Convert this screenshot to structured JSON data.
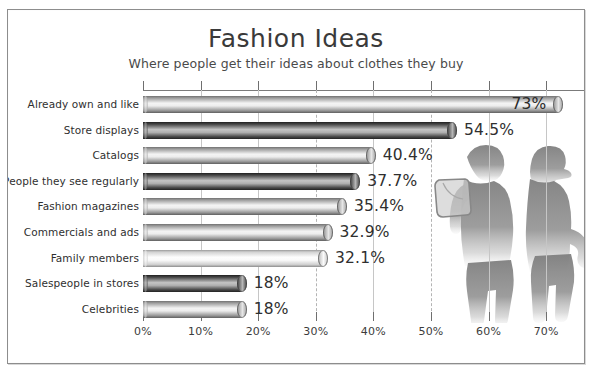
{
  "chart_data": {
    "type": "bar",
    "orientation": "horizontal",
    "title": "Fashion Ideas",
    "subtitle": "Where people get their ideas about clothes they buy",
    "xlabel": "",
    "ylabel": "",
    "xlim": [
      0,
      73
    ],
    "grid": true,
    "legend": false,
    "categories": [
      "Already own and like",
      "Store displays",
      "Catalogs",
      "People they see regularly",
      "Fashion magazines",
      "Commercials and ads",
      "Family members",
      "Salespeople in stores",
      "Celebrities"
    ],
    "values": [
      73,
      54.5,
      40.4,
      37.7,
      35.4,
      32.9,
      32.1,
      18,
      18
    ],
    "value_labels": [
      "73%",
      "54.5%",
      "40.4%",
      "37.7%",
      "35.4%",
      "32.9%",
      "32.1%",
      "18%",
      "18%"
    ],
    "xticks": [
      0,
      10,
      20,
      30,
      40,
      50,
      60,
      70
    ],
    "xtick_labels": [
      "0%",
      "10%",
      "20%",
      "30%",
      "40%",
      "50%",
      "60%",
      "70%"
    ],
    "bar_tones": [
      "light",
      "dark",
      "light",
      "dark",
      "light",
      "light",
      "lightest",
      "dark",
      "light"
    ],
    "annotation": "Two shopper silhouettes watermark at right side of plot"
  },
  "bars": [
    {
      "label": "Already own and like",
      "value": 73,
      "display": "73%",
      "tone": "light",
      "label_inside": true
    },
    {
      "label": "Store displays",
      "value": 54.5,
      "display": "54.5%",
      "tone": "dark",
      "label_inside": false
    },
    {
      "label": "Catalogs",
      "value": 40.4,
      "display": "40.4%",
      "tone": "light",
      "label_inside": false
    },
    {
      "label": "People they see regularly",
      "value": 37.7,
      "display": "37.7%",
      "tone": "dark",
      "label_inside": false
    },
    {
      "label": "Fashion magazines",
      "value": 35.4,
      "display": "35.4%",
      "tone": "light",
      "label_inside": false
    },
    {
      "label": "Commercials and ads",
      "value": 32.9,
      "display": "32.9%",
      "tone": "light",
      "label_inside": false
    },
    {
      "label": "Family members",
      "value": 32.1,
      "display": "32.1%",
      "tone": "lightest",
      "label_inside": false
    },
    {
      "label": "Salespeople in stores",
      "value": 18,
      "display": "18%",
      "tone": "dark",
      "label_inside": false
    },
    {
      "label": "Celebrities",
      "value": 18,
      "display": "18%",
      "tone": "light",
      "label_inside": false
    }
  ],
  "colors": {
    "frame_border": "#8d8d8d",
    "gridline": "#c6c6c6",
    "axis": "#7b7b7b",
    "text": "#2f2f2f",
    "silhouette": "#8a8a8a",
    "bar_light_mid": "#f2f2f2",
    "bar_light_edge": "#6e6e6e",
    "bar_dark_mid": "#bdbdbd",
    "bar_dark_edge": "#2e2e2e",
    "bar_lightest_mid": "#fbfbfb",
    "bar_lightest_edge": "#8f8f8f"
  }
}
